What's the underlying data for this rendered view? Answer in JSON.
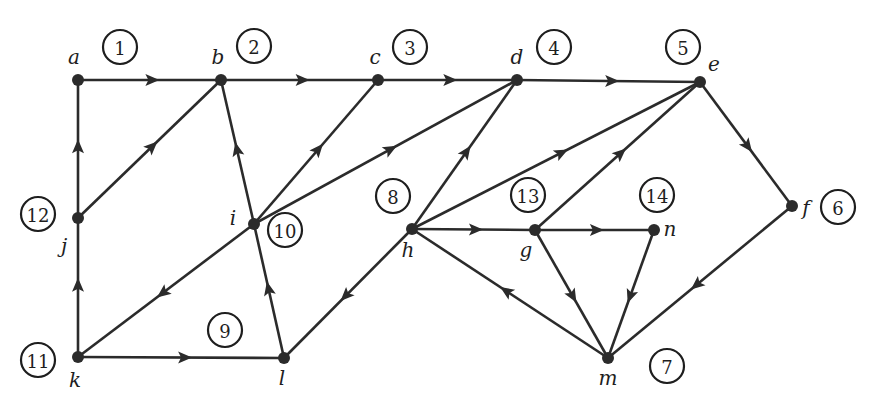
{
  "diagram": {
    "type": "directed-graph",
    "nodes": [
      {
        "id": "a",
        "label": "a",
        "order": "1",
        "x": 78,
        "y": 80,
        "lx": 74,
        "ly": 57,
        "ox": 120,
        "oy": 47
      },
      {
        "id": "b",
        "label": "b",
        "order": "2",
        "x": 221,
        "y": 80,
        "lx": 218,
        "ly": 57,
        "ox": 254,
        "oy": 46
      },
      {
        "id": "c",
        "label": "c",
        "order": "3",
        "x": 378,
        "y": 80,
        "lx": 375,
        "ly": 57,
        "ox": 410,
        "oy": 47
      },
      {
        "id": "d",
        "label": "d",
        "order": "4",
        "x": 517,
        "y": 80,
        "lx": 517,
        "ly": 57,
        "ox": 554,
        "oy": 47
      },
      {
        "id": "e",
        "label": "e",
        "order": "5",
        "x": 700,
        "y": 82,
        "lx": 714,
        "ly": 64,
        "ox": 683,
        "oy": 47
      },
      {
        "id": "f",
        "label": "f",
        "order": "6",
        "x": 792,
        "y": 206,
        "lx": 806,
        "ly": 208,
        "ox": 838,
        "oy": 207
      },
      {
        "id": "m",
        "label": "m",
        "order": "7",
        "x": 608,
        "y": 358,
        "lx": 608,
        "ly": 378,
        "ox": 667,
        "oy": 366
      },
      {
        "id": "h",
        "label": "h",
        "order": "8",
        "x": 412,
        "y": 229,
        "lx": 408,
        "ly": 250,
        "ox": 393,
        "oy": 196
      },
      {
        "id": "l",
        "label": "l",
        "order": "9",
        "x": 284,
        "y": 358,
        "lx": 282,
        "ly": 378,
        "ox": 225,
        "oy": 330
      },
      {
        "id": "i",
        "label": "i",
        "order": "10",
        "x": 254,
        "y": 224,
        "lx": 233,
        "ly": 218,
        "ox": 285,
        "oy": 230
      },
      {
        "id": "k",
        "label": "k",
        "order": "11",
        "x": 78,
        "y": 357,
        "lx": 75,
        "ly": 380,
        "ox": 38,
        "oy": 360
      },
      {
        "id": "j",
        "label": "j",
        "order": "12",
        "x": 78,
        "y": 218,
        "lx": 64,
        "ly": 246,
        "ox": 38,
        "oy": 214
      },
      {
        "id": "g",
        "label": "g",
        "order": "13",
        "x": 535,
        "y": 230,
        "lx": 526,
        "ly": 250,
        "ox": 528,
        "oy": 195
      },
      {
        "id": "n",
        "label": "n",
        "order": "14",
        "x": 654,
        "y": 230,
        "lx": 670,
        "ly": 229,
        "ox": 657,
        "oy": 195
      }
    ],
    "edges": [
      {
        "from": "a",
        "to": "b"
      },
      {
        "from": "b",
        "to": "c"
      },
      {
        "from": "c",
        "to": "d"
      },
      {
        "from": "d",
        "to": "e"
      },
      {
        "from": "j",
        "to": "a"
      },
      {
        "from": "j",
        "to": "b"
      },
      {
        "from": "k",
        "to": "j"
      },
      {
        "from": "k",
        "to": "l"
      },
      {
        "from": "l",
        "to": "i"
      },
      {
        "from": "i",
        "to": "b"
      },
      {
        "from": "i",
        "to": "c"
      },
      {
        "from": "i",
        "to": "d"
      },
      {
        "from": "i",
        "to": "k"
      },
      {
        "from": "h",
        "to": "l"
      },
      {
        "from": "h",
        "to": "d"
      },
      {
        "from": "h",
        "to": "e"
      },
      {
        "from": "h",
        "to": "g"
      },
      {
        "from": "g",
        "to": "e"
      },
      {
        "from": "g",
        "to": "n"
      },
      {
        "from": "g",
        "to": "m"
      },
      {
        "from": "n",
        "to": "m"
      },
      {
        "from": "m",
        "to": "h"
      },
      {
        "from": "e",
        "to": "f"
      },
      {
        "from": "f",
        "to": "m"
      }
    ],
    "colors": {
      "background": "#ffffff",
      "ink": "#2b2b2b"
    }
  }
}
